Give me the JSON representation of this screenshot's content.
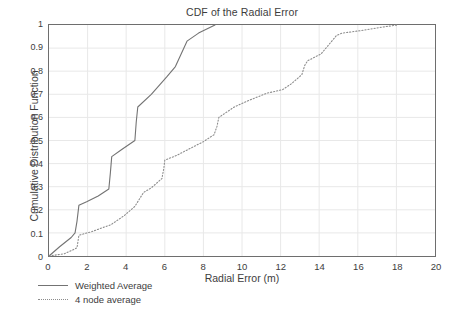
{
  "chart_data": {
    "type": "line",
    "title": "CDF of the Radial Error",
    "xlabel": "Radial Error (m)",
    "ylabel": "Cumulative Distribution Function",
    "xlim": [
      0,
      20
    ],
    "ylim": [
      0,
      1
    ],
    "grid": true,
    "legend_position": "below-left",
    "xticks": [
      "0",
      "2",
      "4",
      "6",
      "8",
      "10",
      "12",
      "14",
      "16",
      "18",
      "20"
    ],
    "xtick_values": [
      0,
      2,
      4,
      6,
      8,
      10,
      12,
      14,
      16,
      18,
      20
    ],
    "yticks": [
      "0",
      "0.1",
      "0.2",
      "0.3",
      "0.4",
      "0.5",
      "0.6",
      "0.7",
      "0.8",
      "0.9",
      "1"
    ],
    "ytick_values": [
      0,
      0.1,
      0.2,
      0.3,
      0.4,
      0.5,
      0.6,
      0.7,
      0.8,
      0.9,
      1
    ],
    "series": [
      {
        "name": "Weighted Average",
        "style": "solid",
        "color": "#737373",
        "points": [
          [
            0.0,
            0.0
          ],
          [
            0.55,
            0.04
          ],
          [
            1.15,
            0.08
          ],
          [
            1.35,
            0.1
          ],
          [
            1.45,
            0.15
          ],
          [
            1.55,
            0.22
          ],
          [
            1.95,
            0.235
          ],
          [
            2.55,
            0.26
          ],
          [
            3.1,
            0.29
          ],
          [
            3.18,
            0.36
          ],
          [
            3.25,
            0.43
          ],
          [
            3.75,
            0.46
          ],
          [
            4.45,
            0.5
          ],
          [
            4.52,
            0.58
          ],
          [
            4.6,
            0.645
          ],
          [
            5.3,
            0.7
          ],
          [
            6.1,
            0.775
          ],
          [
            6.55,
            0.82
          ],
          [
            7.15,
            0.93
          ],
          [
            7.75,
            0.965
          ],
          [
            8.6,
            1.0
          ]
        ]
      },
      {
        "name": "4 node average",
        "style": "dotted",
        "color": "#8c8c8c",
        "points": [
          [
            0.0,
            0.0
          ],
          [
            0.8,
            0.01
          ],
          [
            1.45,
            0.035
          ],
          [
            1.55,
            0.09
          ],
          [
            2.2,
            0.105
          ],
          [
            2.85,
            0.125
          ],
          [
            3.2,
            0.135
          ],
          [
            3.9,
            0.175
          ],
          [
            4.45,
            0.215
          ],
          [
            4.9,
            0.275
          ],
          [
            5.3,
            0.295
          ],
          [
            5.85,
            0.335
          ],
          [
            5.95,
            0.38
          ],
          [
            6.0,
            0.415
          ],
          [
            6.6,
            0.435
          ],
          [
            7.3,
            0.465
          ],
          [
            8.0,
            0.495
          ],
          [
            8.55,
            0.525
          ],
          [
            8.7,
            0.56
          ],
          [
            8.8,
            0.6
          ],
          [
            9.6,
            0.645
          ],
          [
            10.4,
            0.675
          ],
          [
            11.3,
            0.705
          ],
          [
            12.1,
            0.72
          ],
          [
            12.55,
            0.745
          ],
          [
            13.1,
            0.785
          ],
          [
            13.25,
            0.825
          ],
          [
            13.4,
            0.845
          ],
          [
            14.1,
            0.875
          ],
          [
            14.9,
            0.955
          ],
          [
            15.2,
            0.965
          ],
          [
            16.1,
            0.975
          ],
          [
            17.2,
            0.99
          ],
          [
            18.05,
            1.0
          ]
        ]
      }
    ]
  },
  "legend": {
    "items": [
      {
        "label": "Weighted Average",
        "style": "solid"
      },
      {
        "label": "4 node average",
        "style": "dotted"
      }
    ]
  },
  "colors": {
    "axis": "#6e6e6e",
    "grid": "#e8e8e8",
    "text": "#3d3d3d",
    "background": "#ffffff",
    "series_solid": "#737373",
    "series_dotted": "#8c8c8c"
  }
}
